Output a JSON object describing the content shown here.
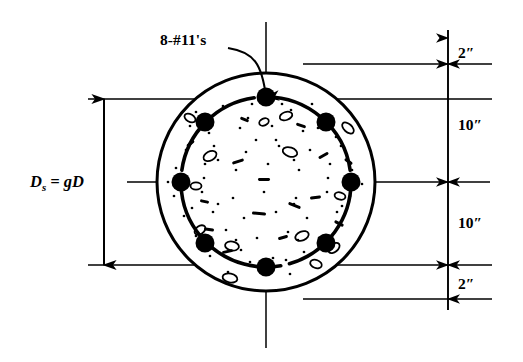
{
  "figure": {
    "type": "engineering-cross-section",
    "background_color": "#ffffff",
    "ink_color": "#000000"
  },
  "callout": {
    "label": "8-#11's",
    "meaning": "eight number 11 reinforcing bars",
    "x": 160,
    "y": 45,
    "leader": {
      "from_x": 228,
      "from_y": 48,
      "to_x": 266,
      "to_y": 97
    }
  },
  "left_dimension": {
    "label_main": "D",
    "label_sub": "s",
    "label_rest": " = gD",
    "plain": "Ds = gD",
    "meaning": "diameter of spiral equals g times D",
    "text_x": 30,
    "text_y": 187,
    "line_x": 104,
    "top_y": 99,
    "bottom_y": 265
  },
  "right_dimensions": {
    "chain_x": 448,
    "label_offset_x": 10,
    "segments": [
      {
        "label": "2″",
        "value": 2,
        "unit": "in",
        "top_y": 38,
        "bottom_y": 64,
        "label_y": 58,
        "meaning": "clear cover top"
      },
      {
        "label": "10″",
        "value": 10,
        "unit": "in",
        "top_y": 64,
        "bottom_y": 182,
        "label_y": 130,
        "meaning": "upper half of spiral diameter"
      },
      {
        "label": "10″",
        "value": 10,
        "unit": "in",
        "top_y": 182,
        "bottom_y": 265,
        "label_y": 228,
        "meaning": "lower half of spiral diameter"
      },
      {
        "label": "2″",
        "value": 2,
        "unit": "in",
        "top_y": 265,
        "bottom_y": 299,
        "label_y": 289,
        "meaning": "clear cover bottom"
      }
    ],
    "tail_top_y": 30,
    "tail_bottom_y": 310
  },
  "extension_lines": [
    {
      "name": "top-cover",
      "x1": 303,
      "y1": 64,
      "x2": 492,
      "y2": 64
    },
    {
      "name": "spiral-top",
      "x1": 88,
      "y1": 99,
      "x2": 492,
      "y2": 99
    },
    {
      "name": "spiral-bottom",
      "x1": 88,
      "y1": 265,
      "x2": 492,
      "y2": 265
    },
    {
      "name": "bottom-cover",
      "x1": 303,
      "y1": 299,
      "x2": 492,
      "y2": 299
    }
  ],
  "centerlines": {
    "vertical": {
      "x": 266,
      "y1": 22,
      "y2": 348
    },
    "horizontal": {
      "y": 182,
      "x1": 127,
      "x2": 490
    }
  },
  "column": {
    "center_x": 266,
    "center_y": 182,
    "outer_radius": 109,
    "spiral_radius": 85,
    "outer_stroke_width": 3,
    "spiral_stroke_width": 3.6
  },
  "rebars": {
    "count": 8,
    "size_designation": "#11",
    "radius": 85,
    "dot_radius": 9.5,
    "angles_deg": [
      270,
      315,
      0,
      45,
      90,
      135,
      180,
      225
    ],
    "positions": [
      {
        "name": "top",
        "x": 266,
        "y": 97
      },
      {
        "name": "upper-right",
        "x": 326,
        "y": 122
      },
      {
        "name": "right",
        "x": 351,
        "y": 182
      },
      {
        "name": "lower-right",
        "x": 326,
        "y": 243
      },
      {
        "name": "bottom",
        "x": 266,
        "y": 267
      },
      {
        "name": "lower-left",
        "x": 205,
        "y": 243
      },
      {
        "name": "left",
        "x": 181,
        "y": 182
      },
      {
        "name": "upper-left",
        "x": 205,
        "y": 122
      }
    ]
  },
  "spiral_arcs": [
    {
      "start_deg": 188,
      "end_deg": 262
    },
    {
      "start_deg": 268,
      "end_deg": 352
    },
    {
      "start_deg": 358,
      "end_deg": 74
    },
    {
      "start_deg": 80,
      "end_deg": 130
    },
    {
      "start_deg": 140,
      "end_deg": 178
    }
  ],
  "aggregate": {
    "description": "stippled concrete fill with speckles and hollow aggregate outlines",
    "speckles": [
      [
        196,
        112
      ],
      [
        223,
        106
      ],
      [
        248,
        118
      ],
      [
        291,
        110
      ],
      [
        312,
        104
      ],
      [
        333,
        118
      ],
      [
        209,
        133
      ],
      [
        240,
        128
      ],
      [
        272,
        126
      ],
      [
        303,
        131
      ],
      [
        336,
        137
      ],
      [
        186,
        150
      ],
      [
        214,
        146
      ],
      [
        246,
        152
      ],
      [
        279,
        146
      ],
      [
        310,
        150
      ],
      [
        341,
        146
      ],
      [
        176,
        168
      ],
      [
        205,
        164
      ],
      [
        236,
        170
      ],
      [
        268,
        164
      ],
      [
        299,
        170
      ],
      [
        330,
        164
      ],
      [
        352,
        170
      ],
      [
        174,
        196
      ],
      [
        202,
        192
      ],
      [
        233,
        198
      ],
      [
        264,
        192
      ],
      [
        296,
        198
      ],
      [
        327,
        192
      ],
      [
        350,
        196
      ],
      [
        184,
        216
      ],
      [
        213,
        212
      ],
      [
        244,
        218
      ],
      [
        276,
        212
      ],
      [
        307,
        218
      ],
      [
        337,
        212
      ],
      [
        196,
        236
      ],
      [
        226,
        230
      ],
      [
        257,
        238
      ],
      [
        288,
        232
      ],
      [
        319,
        238
      ],
      [
        210,
        256
      ],
      [
        241,
        250
      ],
      [
        273,
        258
      ],
      [
        304,
        252
      ],
      [
        228,
        272
      ],
      [
        259,
        266
      ],
      [
        290,
        274
      ],
      [
        190,
        126
      ],
      [
        318,
        128
      ],
      [
        192,
        208
      ],
      [
        342,
        206
      ],
      [
        252,
        104
      ],
      [
        282,
        104
      ],
      [
        250,
        262
      ],
      [
        286,
        260
      ],
      [
        168,
        182
      ],
      [
        362,
        184
      ],
      [
        218,
        160
      ],
      [
        294,
        160
      ],
      [
        218,
        204
      ],
      [
        294,
        204
      ],
      [
        236,
        240
      ],
      [
        298,
        240
      ],
      [
        204,
        178
      ],
      [
        328,
        178
      ],
      [
        256,
        140
      ],
      [
        276,
        140
      ]
    ],
    "dashes": [
      [
        232,
        160,
        12,
        3,
        -18
      ],
      [
        288,
        204,
        13,
        3,
        22
      ],
      [
        204,
        228,
        10,
        3,
        8
      ],
      [
        318,
        154,
        11,
        3,
        -30
      ],
      [
        252,
        212,
        14,
        3,
        5
      ],
      [
        296,
        124,
        10,
        3,
        18
      ],
      [
        222,
        250,
        11,
        3,
        -12
      ],
      [
        334,
        222,
        10,
        3,
        28
      ],
      [
        186,
        142,
        9,
        3,
        -40
      ],
      [
        344,
        160,
        9,
        3,
        35
      ],
      [
        258,
        178,
        12,
        3,
        0
      ],
      [
        278,
        236,
        10,
        3,
        -15
      ],
      [
        200,
        200,
        9,
        3,
        12
      ],
      [
        310,
        196,
        11,
        3,
        -8
      ],
      [
        240,
        118,
        9,
        3,
        22
      ]
    ],
    "blobs": [
      [
        210,
        156,
        7,
        4.5,
        -28
      ],
      [
        290,
        152,
        7.5,
        4.5,
        18
      ],
      [
        232,
        246,
        7,
        4.5,
        10
      ],
      [
        302,
        236,
        7,
        4.5,
        -22
      ],
      [
        348,
        128,
        7,
        4,
        42
      ],
      [
        200,
        230,
        6,
        4,
        -35
      ],
      [
        230,
        278,
        7.5,
        4.5,
        12
      ],
      [
        286,
        116,
        6.5,
        4,
        -20
      ],
      [
        190,
        118,
        6,
        3.8,
        30
      ],
      [
        334,
        248,
        6.5,
        4,
        -40
      ],
      [
        196,
        186,
        5.5,
        3.6,
        0
      ],
      [
        340,
        196,
        5.5,
        3.6,
        15
      ],
      [
        264,
        122,
        5,
        3.4,
        -25
      ],
      [
        316,
        264,
        6,
        4,
        20
      ]
    ]
  }
}
